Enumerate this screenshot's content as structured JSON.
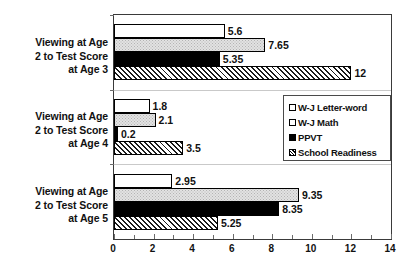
{
  "chart_data": {
    "type": "bar",
    "orientation": "horizontal",
    "title": "",
    "subtitle": "",
    "xlabel": "",
    "ylabel": "",
    "xlim": [
      0,
      14
    ],
    "xticks": [
      0,
      2,
      4,
      6,
      8,
      10,
      12,
      14
    ],
    "xtick_labels": [
      "0",
      "2",
      "4",
      "6",
      "8",
      "10",
      "12",
      "14"
    ],
    "xtick_step": 2,
    "minor_tick_step": 1,
    "grid": false,
    "legend_position": "center-right",
    "categories": [
      "Viewing at Age 2 to Test Score at Age 3",
      "Viewing at Age 2 to Test Score at Age 4",
      "Viewing at Age 2 to Test Score at Age 5"
    ],
    "category_label_lines": [
      [
        "Viewing at Age",
        "2 to Test Score",
        "at Age 3"
      ],
      [
        "Viewing at Age",
        "2 to Test Score",
        "at Age 4"
      ],
      [
        "Viewing at Age",
        "2 to Test Score",
        "at Age 5"
      ]
    ],
    "series": [
      {
        "name": "W-J Letter-word",
        "fill": "white",
        "values": [
          5.6,
          1.8,
          2.95
        ],
        "value_labels": [
          "5.6",
          "1.8",
          "2.95"
        ]
      },
      {
        "name": "W-J Math",
        "fill": "light-gray-stipple",
        "values": [
          7.65,
          2.1,
          9.35
        ],
        "value_labels": [
          "7.65",
          "2.1",
          "9.35"
        ]
      },
      {
        "name": "PPVT",
        "fill": "black",
        "values": [
          5.35,
          0.2,
          8.35
        ],
        "value_labels": [
          "5.35",
          "0.2",
          "8.35"
        ]
      },
      {
        "name": "School Readiness",
        "fill": "diagonal-hatch",
        "values": [
          12,
          3.5,
          5.25
        ],
        "value_labels": [
          "12",
          "3.5",
          "5.25"
        ]
      }
    ]
  },
  "legend": {
    "items": [
      {
        "label": "W-J Letter-word",
        "swatch": "white-square"
      },
      {
        "label": "W-J Math",
        "swatch": "white-square"
      },
      {
        "label": "PPVT",
        "swatch": "black-square"
      },
      {
        "label": "School Readiness",
        "swatch": "hatched-square"
      }
    ]
  },
  "colors": {
    "axis": "#3a3a3a",
    "text": "#111111",
    "bar_white": "#ffffff",
    "bar_gray": "#e2e2e2",
    "bar_black": "#000000",
    "background": "#ffffff"
  }
}
